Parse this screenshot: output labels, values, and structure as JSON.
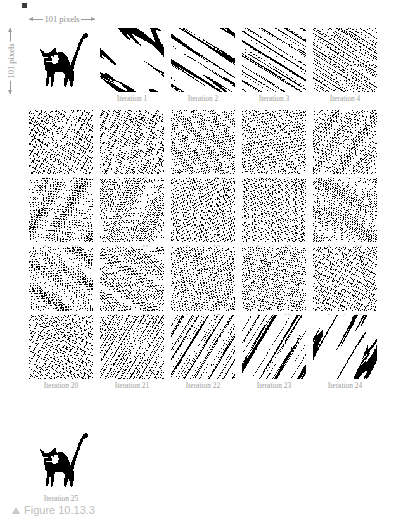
{
  "figure": {
    "caption_marker": "▲",
    "caption_text": "Figure 10.13.3",
    "background_color": "#ffffff",
    "label_color": "#9b9b9b",
    "annotation_color": "#8d8d8d",
    "caption_color": "#bdbdbd",
    "ink_color": "#000000"
  },
  "annotations": {
    "horizontal": "101 pixels",
    "vertical": "101 pixels"
  },
  "grid": {
    "columns": 5,
    "cell_size_px": 64,
    "col_x": [
      29,
      100,
      171,
      242,
      313
    ],
    "row_y": [
      28,
      110,
      178,
      247,
      315
    ],
    "label_offset_px": 65
  },
  "cells": [
    {
      "name": "original",
      "label": "",
      "row": 0,
      "col": 0,
      "iteration": 0,
      "kind": "cat"
    },
    {
      "name": "iteration-1",
      "label": "Iteration 1",
      "row": 0,
      "col": 1,
      "iteration": 1,
      "kind": "map"
    },
    {
      "name": "iteration-2",
      "label": "Iteration 2",
      "row": 0,
      "col": 2,
      "iteration": 2,
      "kind": "map"
    },
    {
      "name": "iteration-3",
      "label": "Iteration 3",
      "row": 0,
      "col": 3,
      "iteration": 3,
      "kind": "map"
    },
    {
      "name": "iteration-4",
      "label": "Iteration 4",
      "row": 0,
      "col": 4,
      "iteration": 4,
      "kind": "map"
    },
    {
      "name": "iteration-5",
      "label": "Iteration 5",
      "row": 1,
      "col": 0,
      "iteration": 5,
      "kind": "map"
    },
    {
      "name": "iteration-6",
      "label": "Iteration 6",
      "row": 1,
      "col": 1,
      "iteration": 6,
      "kind": "map"
    },
    {
      "name": "iteration-7",
      "label": "Iteration 7",
      "row": 1,
      "col": 2,
      "iteration": 7,
      "kind": "map"
    },
    {
      "name": "iteration-8",
      "label": "Iteration 8",
      "row": 1,
      "col": 3,
      "iteration": 8,
      "kind": "map"
    },
    {
      "name": "iteration-9",
      "label": "Iteration 9",
      "row": 1,
      "col": 4,
      "iteration": 9,
      "kind": "map"
    },
    {
      "name": "iteration-10",
      "label": "Iteration 10",
      "row": 2,
      "col": 0,
      "iteration": 10,
      "kind": "map"
    },
    {
      "name": "iteration-11",
      "label": "Iteration 11",
      "row": 2,
      "col": 1,
      "iteration": 11,
      "kind": "map"
    },
    {
      "name": "iteration-12",
      "label": "Iteration 12",
      "row": 2,
      "col": 2,
      "iteration": 12,
      "kind": "map"
    },
    {
      "name": "iteration-13",
      "label": "Iteration 13",
      "row": 2,
      "col": 3,
      "iteration": 13,
      "kind": "map"
    },
    {
      "name": "iteration-14",
      "label": "Iteration 14",
      "row": 2,
      "col": 4,
      "iteration": 14,
      "kind": "map"
    },
    {
      "name": "iteration-15",
      "label": "Iteration 15",
      "row": 3,
      "col": 0,
      "iteration": 15,
      "kind": "map"
    },
    {
      "name": "iteration-16",
      "label": "Iteration 16",
      "row": 3,
      "col": 1,
      "iteration": 16,
      "kind": "map"
    },
    {
      "name": "iteration-17",
      "label": "Iteration 17",
      "row": 3,
      "col": 2,
      "iteration": 17,
      "kind": "map"
    },
    {
      "name": "iteration-18",
      "label": "Iteration 18",
      "row": 3,
      "col": 3,
      "iteration": 18,
      "kind": "map"
    },
    {
      "name": "iteration-19",
      "label": "Iteration 19",
      "row": 3,
      "col": 4,
      "iteration": 19,
      "kind": "map"
    },
    {
      "name": "iteration-20",
      "label": "Iteration 20",
      "row": 4,
      "col": 0,
      "iteration": 20,
      "kind": "map"
    },
    {
      "name": "iteration-21",
      "label": "Iteration 21",
      "row": 4,
      "col": 1,
      "iteration": 21,
      "kind": "map"
    },
    {
      "name": "iteration-22",
      "label": "Iteration 22",
      "row": 4,
      "col": 2,
      "iteration": 22,
      "kind": "map"
    },
    {
      "name": "iteration-23",
      "label": "Iteration 23",
      "row": 4,
      "col": 3,
      "iteration": 23,
      "kind": "map"
    },
    {
      "name": "iteration-24",
      "label": "Iteration 24",
      "row": 4,
      "col": 4,
      "iteration": 24,
      "kind": "map"
    },
    {
      "name": "iteration-25",
      "label": "Iteration 25",
      "row": 5,
      "col": 0,
      "iteration": 25,
      "kind": "cat"
    }
  ],
  "final_cell": {
    "x": 29,
    "y": 428,
    "label_y": 493
  }
}
